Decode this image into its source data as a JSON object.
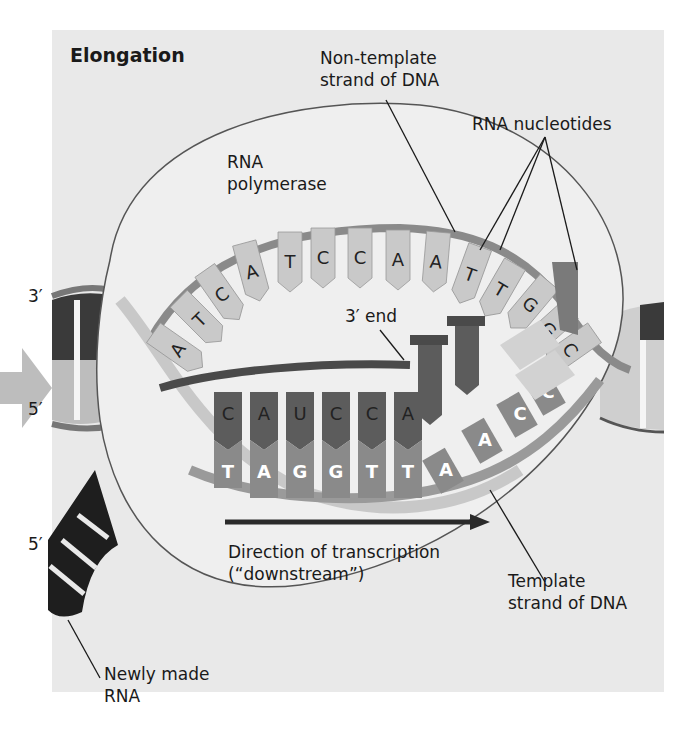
{
  "title": "Elongation",
  "labels": {
    "non_template_line1": "Non-template",
    "non_template_line2": "strand of DNA",
    "rna_nucleotides": "RNA nucleotides",
    "rna_polymerase_line1": "RNA",
    "rna_polymerase_line2": "polymerase",
    "three_prime_end": "3′ end",
    "direction_line1": "Direction of transcription",
    "direction_line2": "(“downstream”)",
    "template_line1": "Template",
    "template_line2": "strand of DNA",
    "newly_made_line1": "Newly made",
    "newly_made_line2": "RNA",
    "left_top_3prime": "3′",
    "left_mid_5prime": "5′",
    "left_low_5prime": "5′"
  },
  "non_template_bases": [
    "A",
    "T",
    "C",
    "A",
    "T",
    "C",
    "C",
    "A",
    "A",
    "T",
    "T",
    "G",
    "G",
    "C"
  ],
  "rna_bases": [
    "C",
    "A",
    "U",
    "C",
    "C",
    "A",
    "A",
    "U"
  ],
  "free_nucleotide": "U",
  "template_bases": [
    "T",
    "A",
    "G",
    "G",
    "T",
    "T",
    "A",
    "A",
    "C",
    "C"
  ],
  "colors": {
    "background": "#e9e9e9",
    "polymerase_fill": "#eeeeee",
    "non_template_base": "#c9c9c9",
    "rna_base": "#5c5c5c",
    "template_base": "#8a8a8a",
    "backbone": "#6e6e6e",
    "rna_exit": "#1e1e1e"
  }
}
